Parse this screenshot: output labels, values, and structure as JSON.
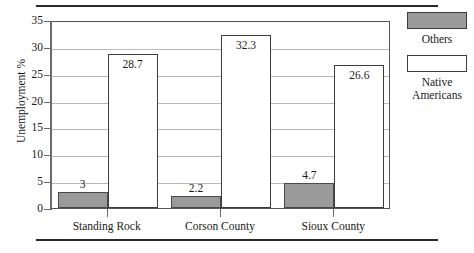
{
  "chart_data": {
    "type": "bar",
    "title": "",
    "xlabel": "",
    "ylabel": "Unemployment %",
    "categories": [
      "Standing Rock",
      "Corson County",
      "Sioux County"
    ],
    "series": [
      {
        "name": "Others",
        "values": [
          3,
          2.2,
          4.7
        ],
        "value_labels": [
          "3",
          "2.2",
          "4.7"
        ],
        "color": "#9a9a9a"
      },
      {
        "name": "Native Americans",
        "values": [
          28.7,
          32.3,
          26.6
        ],
        "value_labels": [
          "28.7",
          "32.3",
          "26.6"
        ],
        "color": "#ffffff"
      }
    ],
    "ylim": [
      0,
      35
    ],
    "yticks": [
      0,
      5,
      10,
      15,
      20,
      25,
      30,
      35
    ],
    "ytick_labels": [
      "0",
      "5",
      "10",
      "15",
      "20",
      "25",
      "30",
      "35"
    ],
    "grid": true,
    "legend_position": "right"
  },
  "legend": {
    "entries": [
      {
        "label": "Others",
        "swatch": "filled-gray-swatch"
      },
      {
        "label": "Native Americans",
        "swatch": "empty-white-swatch"
      }
    ]
  }
}
